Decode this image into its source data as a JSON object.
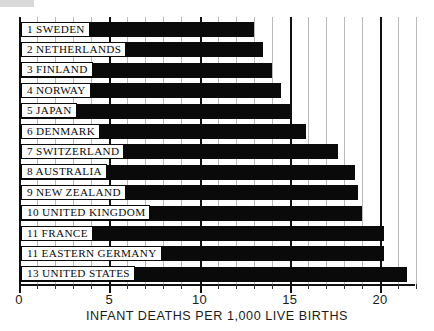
{
  "chart_data": {
    "type": "bar",
    "orientation": "horizontal",
    "title": "",
    "xlabel": "INFANT DEATHS PER 1,000 LIVE BIRTHS",
    "ylabel": "",
    "xlim": [
      0,
      22.9
    ],
    "xticks": [
      0,
      5,
      10,
      15,
      20
    ],
    "xticklabels": [
      "0",
      "5",
      "10",
      "15",
      "20"
    ],
    "minor_tick_step": 1,
    "grid": true,
    "grid_axis": "x",
    "legend": false,
    "categories": [
      "1 SWEDEN",
      "2 NETHERLANDS",
      "3 FINLAND",
      "4 NORWAY",
      "5 JAPAN",
      "6 DENMARK",
      "7 SWITZERLAND",
      "8 AUSTRALIA",
      "9 NEW ZEALAND",
      "10 UNITED KINGDOM",
      "11 FRANCE",
      "11 EASTERN GERMANY",
      "13 UNITED STATES"
    ],
    "values": [
      13.0,
      13.5,
      14.0,
      14.5,
      15.0,
      15.9,
      17.7,
      18.6,
      18.8,
      19.0,
      20.2,
      20.2,
      21.5
    ],
    "bar_color": "#0a0a0a",
    "background_color": "#ffffff"
  },
  "rows": [
    {
      "rank": "1",
      "name": "SWEDEN",
      "label": "1 SWEDEN",
      "value": 13.0
    },
    {
      "rank": "2",
      "name": "NETHERLANDS",
      "label": "2 NETHERLANDS",
      "value": 13.5
    },
    {
      "rank": "3",
      "name": "FINLAND",
      "label": "3 FINLAND",
      "value": 14.0
    },
    {
      "rank": "4",
      "name": "NORWAY",
      "label": "4 NORWAY",
      "value": 14.5
    },
    {
      "rank": "5",
      "name": "JAPAN",
      "label": "5 JAPAN",
      "value": 15.0
    },
    {
      "rank": "6",
      "name": "DENMARK",
      "label": "6 DENMARK",
      "value": 15.9
    },
    {
      "rank": "7",
      "name": "SWITZERLAND",
      "label": "7 SWITZERLAND",
      "value": 17.7
    },
    {
      "rank": "8",
      "name": "AUSTRALIA",
      "label": "8 AUSTRALIA",
      "value": 18.6
    },
    {
      "rank": "9",
      "name": "NEW ZEALAND",
      "label": "9 NEW  ZEALAND",
      "value": 18.8
    },
    {
      "rank": "10",
      "name": "UNITED KINGDOM",
      "label": "10 UNITED  KINGDOM",
      "value": 19.0
    },
    {
      "rank": "11",
      "name": "FRANCE",
      "label": "11 FRANCE",
      "value": 20.2
    },
    {
      "rank": "11",
      "name": "EASTERN GERMANY",
      "label": "11 EASTERN GERMANY",
      "value": 20.2
    },
    {
      "rank": "13",
      "name": "UNITED STATES",
      "label": "13 UNITED  STATES",
      "value": 21.5
    }
  ],
  "axis": {
    "caption": "INFANT DEATHS PER 1,000 LIVE BIRTHS",
    "ticklabels": [
      "0",
      "5",
      "10",
      "15",
      "20"
    ],
    "tickvalues": [
      0,
      5,
      10,
      15,
      20
    ]
  }
}
